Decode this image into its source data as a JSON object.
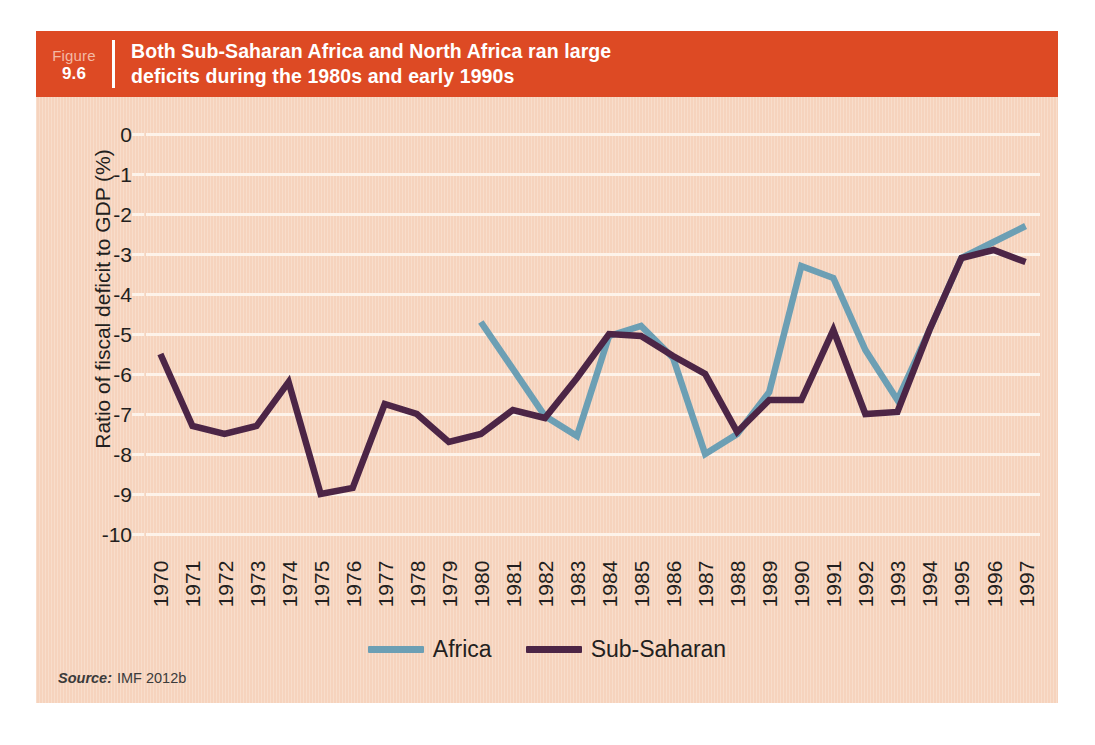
{
  "figure": {
    "label_word": "Figure",
    "number": "9.6",
    "title_line1": "Both Sub-Saharan Africa and North Africa ran large",
    "title_line2": "deficits during the 1980s and early 1990s",
    "header_bg": "#dd4a24",
    "panel_bg": "#f6d3bd"
  },
  "source": {
    "prefix": "Source:",
    "text": "IMF 2012b"
  },
  "chart_data": {
    "type": "line",
    "title": "Both Sub-Saharan Africa and North Africa ran large deficits during the 1980s and early 1990s",
    "xlabel": "",
    "ylabel": "Ratio of fiscal deficit to GDP (%)",
    "ylim": [
      -10,
      0
    ],
    "ytick_labels": [
      "0",
      "-1",
      "-2",
      "-3",
      "-4",
      "-5",
      "-6",
      "-7",
      "-8",
      "-9",
      "-10"
    ],
    "ytick_values": [
      0,
      -1,
      -2,
      -3,
      -4,
      -5,
      -6,
      -7,
      -8,
      -9,
      -10
    ],
    "grid": "horizontal",
    "gridline_color": "#fdf3ea",
    "legend_position": "bottom-center",
    "categories": [
      "1970",
      "1971",
      "1972",
      "1973",
      "1974",
      "1975",
      "1976",
      "1977",
      "1978",
      "1979",
      "1980",
      "1981",
      "1982",
      "1983",
      "1984",
      "1985",
      "1986",
      "1987",
      "1988",
      "1989",
      "1990",
      "1991",
      "1992",
      "1993",
      "1994",
      "1995",
      "1996",
      "1997"
    ],
    "series": [
      {
        "name": "Africa",
        "color": "#6c9fb4",
        "values": [
          null,
          null,
          null,
          null,
          null,
          null,
          null,
          null,
          null,
          null,
          -4.7,
          null,
          -7.05,
          -7.55,
          -5.05,
          -4.8,
          -5.6,
          -8.0,
          -7.5,
          -6.45,
          -3.3,
          -3.6,
          -5.4,
          -6.65,
          -4.9,
          -3.1,
          -2.7,
          -2.3
        ]
      },
      {
        "name": "Sub-Saharan",
        "color": "#4c2546",
        "values": [
          -5.5,
          -7.3,
          -7.5,
          -7.3,
          -6.2,
          -9.0,
          -8.85,
          -6.75,
          -7.0,
          -7.7,
          -7.5,
          -6.9,
          -7.1,
          -6.1,
          -5.0,
          -5.05,
          -5.55,
          -6.0,
          -7.45,
          -6.65,
          -6.65,
          -4.9,
          -7.0,
          -6.95,
          -4.9,
          -3.1,
          -2.9,
          -3.2
        ]
      }
    ]
  }
}
